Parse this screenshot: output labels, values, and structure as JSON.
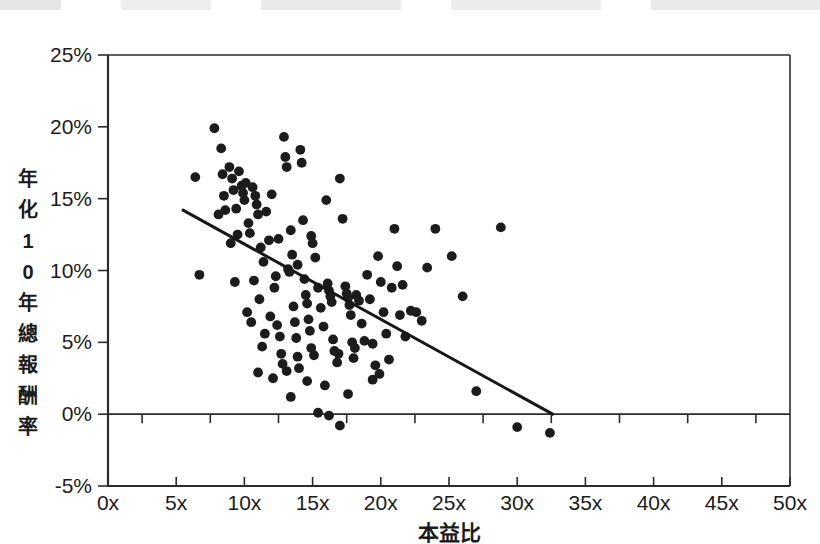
{
  "page": {
    "background": "#ffffff",
    "ink_color": "#1b1b1b",
    "scan_artifact_top": true
  },
  "chart_data": {
    "type": "scatter",
    "title": "",
    "subtitle": "",
    "xlabel": "本益比",
    "ylabel": "年化10年總報酬率",
    "ylabel_chars": [
      "年",
      "化",
      "1",
      "0",
      "年",
      "總",
      "報",
      "酬",
      "率"
    ],
    "xlim": [
      0,
      50
    ],
    "ylim": [
      -5,
      25
    ],
    "grid": false,
    "legend": null,
    "x_tick_labels": [
      "0x",
      "5x",
      "10x",
      "15x",
      "20x",
      "25x",
      "30x",
      "35x",
      "40x",
      "45x",
      "50x"
    ],
    "x_tick_values": [
      0,
      5,
      10,
      15,
      20,
      25,
      30,
      35,
      40,
      45,
      50
    ],
    "x_minor_tick_step": 2.5,
    "y_tick_labels": [
      "25%",
      "20%",
      "15%",
      "10%",
      "5%",
      "0%",
      "-5%"
    ],
    "y_tick_values": [
      25,
      20,
      15,
      10,
      5,
      0,
      -5
    ],
    "zero_reference_line": 0,
    "trendline": {
      "type": "linear",
      "x_start": 5.5,
      "y_start": 14.2,
      "x_end": 32.6,
      "y_end": 0.0,
      "color": "#171717"
    },
    "series": [
      {
        "name": "stocks",
        "marker": "circle",
        "marker_color": "#1c1c1c",
        "marker_size": 9,
        "points": [
          [
            6.4,
            16.5
          ],
          [
            6.7,
            9.7
          ],
          [
            7.8,
            19.9
          ],
          [
            8.3,
            18.5
          ],
          [
            8.4,
            16.7
          ],
          [
            8.5,
            15.2
          ],
          [
            8.6,
            14.2
          ],
          [
            8.9,
            17.2
          ],
          [
            9.1,
            16.4
          ],
          [
            9.2,
            15.6
          ],
          [
            9.4,
            14.3
          ],
          [
            9.5,
            12.5
          ],
          [
            9.6,
            16.9
          ],
          [
            9.8,
            15.9
          ],
          [
            9.9,
            15.4
          ],
          [
            10.0,
            14.9
          ],
          [
            10.1,
            16.1
          ],
          [
            10.3,
            13.3
          ],
          [
            10.4,
            12.6
          ],
          [
            10.6,
            15.8
          ],
          [
            10.8,
            15.2
          ],
          [
            10.9,
            14.6
          ],
          [
            11.0,
            13.9
          ],
          [
            11.2,
            11.6
          ],
          [
            11.4,
            10.6
          ],
          [
            11.6,
            14.1
          ],
          [
            11.8,
            12.1
          ],
          [
            12.0,
            15.3
          ],
          [
            12.2,
            8.8
          ],
          [
            12.4,
            6.2
          ],
          [
            12.6,
            5.4
          ],
          [
            12.7,
            4.2
          ],
          [
            12.9,
            19.3
          ],
          [
            13.0,
            17.9
          ],
          [
            13.1,
            17.2
          ],
          [
            13.2,
            10.1
          ],
          [
            13.3,
            9.9
          ],
          [
            13.4,
            12.8
          ],
          [
            13.5,
            11.1
          ],
          [
            13.6,
            7.5
          ],
          [
            13.7,
            6.4
          ],
          [
            13.8,
            5.3
          ],
          [
            13.9,
            4.0
          ],
          [
            14.0,
            3.2
          ],
          [
            14.1,
            18.4
          ],
          [
            14.2,
            17.5
          ],
          [
            14.3,
            13.5
          ],
          [
            14.4,
            9.4
          ],
          [
            14.5,
            8.3
          ],
          [
            14.6,
            7.7
          ],
          [
            14.7,
            6.6
          ],
          [
            14.8,
            5.8
          ],
          [
            14.9,
            4.6
          ],
          [
            15.0,
            11.9
          ],
          [
            15.2,
            10.9
          ],
          [
            15.4,
            8.8
          ],
          [
            15.6,
            7.4
          ],
          [
            15.8,
            6.1
          ],
          [
            16.0,
            14.9
          ],
          [
            16.1,
            9.1
          ],
          [
            16.2,
            8.6
          ],
          [
            16.3,
            8.2
          ],
          [
            16.4,
            7.8
          ],
          [
            16.5,
            5.2
          ],
          [
            16.6,
            4.4
          ],
          [
            16.8,
            3.6
          ],
          [
            17.0,
            16.4
          ],
          [
            17.2,
            13.6
          ],
          [
            17.4,
            8.9
          ],
          [
            17.5,
            8.4
          ],
          [
            17.6,
            8.1
          ],
          [
            17.7,
            7.6
          ],
          [
            17.8,
            6.9
          ],
          [
            17.9,
            5.0
          ],
          [
            18.0,
            3.9
          ],
          [
            18.2,
            8.3
          ],
          [
            18.4,
            7.9
          ],
          [
            18.6,
            6.3
          ],
          [
            18.8,
            5.1
          ],
          [
            19.0,
            9.7
          ],
          [
            19.2,
            8.0
          ],
          [
            19.4,
            4.9
          ],
          [
            19.6,
            3.4
          ],
          [
            19.8,
            11.0
          ],
          [
            20.0,
            9.2
          ],
          [
            20.2,
            7.1
          ],
          [
            20.4,
            5.6
          ],
          [
            20.6,
            3.8
          ],
          [
            21.0,
            12.9
          ],
          [
            21.2,
            10.3
          ],
          [
            21.4,
            6.9
          ],
          [
            21.8,
            5.4
          ],
          [
            22.2,
            7.2
          ],
          [
            22.6,
            7.1
          ],
          [
            23.0,
            6.5
          ],
          [
            23.4,
            10.2
          ],
          [
            24.0,
            12.9
          ],
          [
            25.2,
            11.0
          ],
          [
            26.0,
            8.2
          ],
          [
            27.0,
            1.6
          ],
          [
            28.8,
            13.0
          ],
          [
            11.0,
            2.9
          ],
          [
            12.1,
            2.5
          ],
          [
            13.4,
            1.2
          ],
          [
            14.6,
            2.3
          ],
          [
            15.4,
            0.1
          ],
          [
            16.2,
            -0.1
          ],
          [
            17.0,
            -0.8
          ],
          [
            17.6,
            1.4
          ],
          [
            19.4,
            2.4
          ],
          [
            30.0,
            -0.9
          ],
          [
            32.4,
            -1.3
          ],
          [
            9.3,
            9.2
          ],
          [
            10.2,
            7.1
          ],
          [
            10.5,
            6.4
          ],
          [
            11.1,
            8.0
          ],
          [
            11.5,
            5.6
          ],
          [
            11.9,
            6.8
          ],
          [
            12.3,
            9.6
          ],
          [
            12.8,
            3.5
          ],
          [
            13.9,
            10.4
          ],
          [
            15.1,
            4.1
          ],
          [
            16.9,
            4.2
          ],
          [
            18.1,
            4.6
          ],
          [
            19.9,
            2.8
          ],
          [
            20.8,
            8.8
          ],
          [
            21.6,
            9.0
          ],
          [
            8.1,
            13.9
          ],
          [
            9.0,
            11.9
          ],
          [
            10.7,
            9.3
          ],
          [
            12.5,
            12.2
          ],
          [
            14.9,
            12.4
          ],
          [
            11.3,
            4.7
          ],
          [
            13.1,
            3.0
          ],
          [
            15.9,
            2.0
          ]
        ]
      }
    ]
  }
}
